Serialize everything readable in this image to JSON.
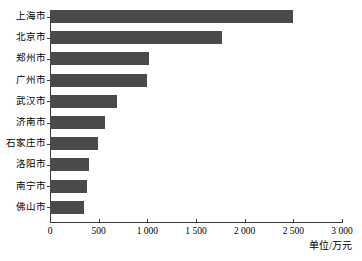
{
  "chart_data": {
    "type": "bar",
    "orientation": "horizontal",
    "title": "",
    "subtitle": "",
    "xlabel": "单位/万元",
    "ylabel": "",
    "categories": [
      "上海市",
      "北京市",
      "郑州市",
      "广州市",
      "武汉市",
      "济南市",
      "石家庄市",
      "洛阳市",
      "南宁市",
      "佛山市"
    ],
    "values": [
      2500,
      1770,
      1020,
      1000,
      690,
      565,
      490,
      400,
      380,
      350
    ],
    "series": [
      {
        "name": "",
        "values": [
          2500,
          1770,
          1020,
          1000,
          690,
          565,
          490,
          400,
          380,
          350
        ]
      }
    ],
    "xlim": [
      0,
      3000
    ],
    "xticks": [
      0,
      500,
      1000,
      1500,
      2000,
      2500,
      3000
    ],
    "xtick_labels": [
      "0",
      "500",
      "1 000",
      "1 500",
      "2 000",
      "2 500",
      "3 000"
    ],
    "grid": false,
    "legend": false,
    "legend_position": "none",
    "bar_color": "#4a4a4a",
    "axis_color": "#3a3a3a",
    "background_color": "#ffffff"
  }
}
